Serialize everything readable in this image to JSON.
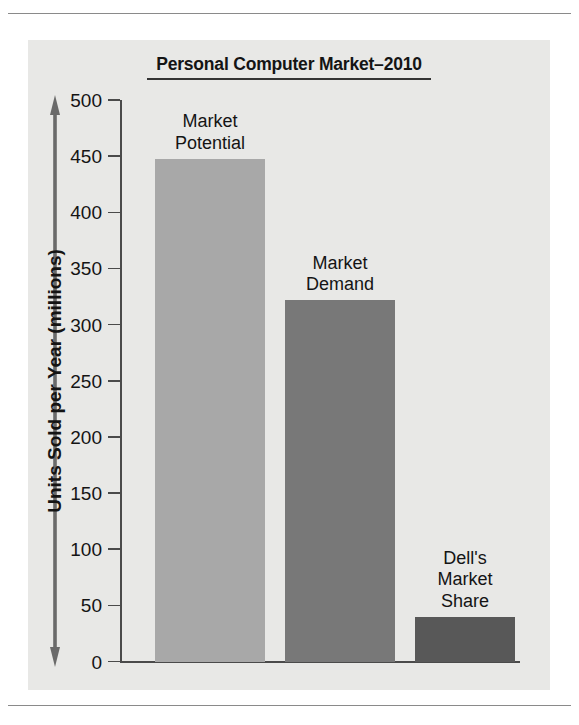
{
  "chart_data": {
    "type": "bar",
    "title": "Personal Computer Market–2010",
    "xlabel": "",
    "ylabel": "Units Sold per Year (millions)",
    "ylim": [
      0,
      500
    ],
    "grid": false,
    "legend": "none",
    "categories": [
      "Market\nPotential",
      "Market\nDemand",
      "Dell's\nMarket\nShare"
    ],
    "values": [
      448,
      322,
      40
    ],
    "y_ticks": [
      500,
      450,
      400,
      350,
      300,
      250,
      200,
      150,
      100,
      50,
      0
    ],
    "bar_colors": [
      "#a8a8a8",
      "#787878",
      "#585858"
    ],
    "bars": [
      {
        "label": "Market\nPotential",
        "value": 448,
        "color": "#a8a8a8"
      },
      {
        "label": "Market\nDemand",
        "value": 322,
        "color": "#787878"
      },
      {
        "label": "Dell's\nMarket\nShare",
        "value": 40,
        "color": "#585858"
      }
    ]
  },
  "panel": {
    "background": "#e8e8e6",
    "axis_color": "#4a4a4a",
    "text_color": "#141414"
  }
}
